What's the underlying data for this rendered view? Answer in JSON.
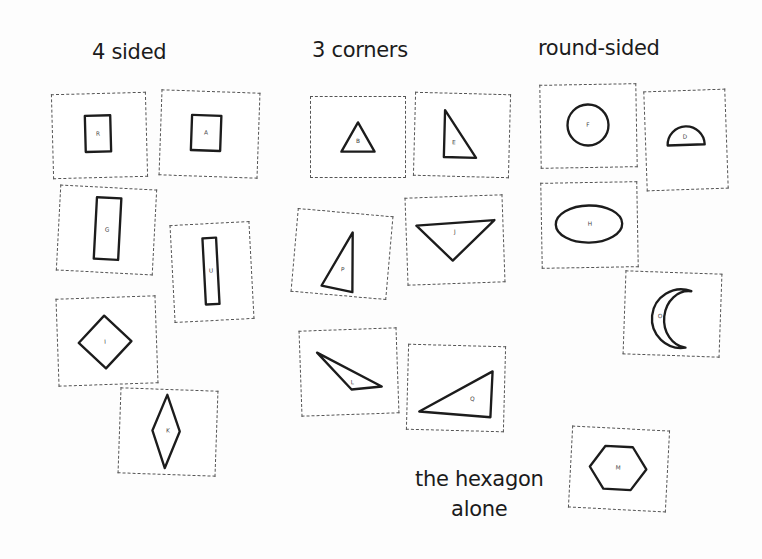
{
  "headings": {
    "four_sided": "4 sided",
    "three_corners": "3 corners",
    "round_sided": "round-sided",
    "hexagon_line1": "the hexagon",
    "hexagon_line2": "alone"
  },
  "colors": {
    "ink": "#1c1c1c",
    "dash": "#555555",
    "paper": "#fdfdfd"
  },
  "groups": [
    {
      "name": "four-sided",
      "cards": [
        {
          "label": "R",
          "shape": "square",
          "x": 52,
          "y": 93,
          "w": 95,
          "h": 85,
          "rot": -1.5,
          "pts": "33,22 59,22 59,59 33,59",
          "lx": 46,
          "ly": 41
        },
        {
          "label": "A",
          "shape": "square",
          "x": 160,
          "y": 91,
          "w": 99,
          "h": 86,
          "rot": 2,
          "pts": "31,24 61,24 61,60 31,60",
          "lx": 46,
          "ly": 42
        },
        {
          "label": "G",
          "shape": "rectangle",
          "x": 58,
          "y": 187,
          "w": 97,
          "h": 86,
          "rot": 3,
          "pts": "37,10 62,10 62,73 37,73",
          "lx": 49,
          "ly": 43
        },
        {
          "label": "U",
          "shape": "rectangle",
          "x": 172,
          "y": 223,
          "w": 80,
          "h": 98,
          "rot": -3,
          "pts": "32,14 46,14 46,82 32,82",
          "lx": 39,
          "ly": 48
        },
        {
          "label": "I",
          "shape": "rhombus-square",
          "x": 57,
          "y": 297,
          "w": 100,
          "h": 88,
          "rot": -2,
          "pts": "48,18 75,45 48,72 21,45",
          "lx": 48,
          "ly": 45
        },
        {
          "label": "K",
          "shape": "rhombus",
          "x": 119,
          "y": 389,
          "w": 98,
          "h": 86,
          "rot": 2,
          "pts": "47,5 61,42 47,80 33,42",
          "lx": 49,
          "ly": 42
        }
      ]
    },
    {
      "name": "three-corners",
      "cards": [
        {
          "label": "B",
          "shape": "equilateral-triangle",
          "x": 310,
          "y": 96,
          "w": 96,
          "h": 82,
          "rot": 0,
          "pts": "48,26 65,56 31,56",
          "lx": 48,
          "ly": 46
        },
        {
          "label": "E",
          "shape": "right-triangle",
          "x": 414,
          "y": 93,
          "w": 96,
          "h": 84,
          "rot": 1.5,
          "pts": "30,17 63,65 30,65",
          "lx": 40,
          "ly": 50
        },
        {
          "label": "P",
          "shape": "acute-triangle",
          "x": 294,
          "y": 212,
          "w": 96,
          "h": 84,
          "rot": 5,
          "pts": "57,19 62,80 30,76",
          "lx": 50,
          "ly": 58
        },
        {
          "label": "J",
          "shape": "inverted-triangle",
          "x": 406,
          "y": 196,
          "w": 98,
          "h": 88,
          "rot": -2,
          "pts": "10,28 90,25 46,65",
          "lx": 49,
          "ly": 36
        },
        {
          "label": "L",
          "shape": "obtuse-triangle",
          "x": 300,
          "y": 329,
          "w": 98,
          "h": 86,
          "rot": -2,
          "pts": "17,22 82,59 51,61",
          "lx": 52,
          "ly": 54
        },
        {
          "label": "Q",
          "shape": "scalene-triangle",
          "x": 407,
          "y": 345,
          "w": 98,
          "h": 86,
          "rot": 1.5,
          "pts": "12,68 86,25 85,72",
          "lx": 66,
          "ly": 54
        }
      ]
    },
    {
      "name": "round-sided",
      "cards": [
        {
          "label": "F",
          "shape": "circle",
          "x": 540,
          "y": 84,
          "w": 97,
          "h": 84,
          "rot": -1,
          "cx": 48,
          "cy": 41,
          "rx": 21,
          "ry": 21,
          "lx": 48,
          "ly": 41
        },
        {
          "label": "D",
          "shape": "semicircle",
          "x": 645,
          "y": 90,
          "w": 82,
          "h": 100,
          "rot": -2,
          "path": "M 22 55 A 19 19 0 0 1 60 55 Z",
          "lx": 40,
          "ly": 47
        },
        {
          "label": "H",
          "shape": "ellipse",
          "x": 541,
          "y": 182,
          "w": 97,
          "h": 86,
          "rot": -1,
          "cx": 48,
          "cy": 42,
          "rx": 34,
          "ry": 19,
          "lx": 49,
          "ly": 42
        },
        {
          "label": "O",
          "shape": "crescent",
          "x": 624,
          "y": 272,
          "w": 97,
          "h": 84,
          "rot": 2,
          "path": "M 67 18 A 30 30 0 1 0 63 76 A 24 28 0 1 1 67 18 Z",
          "lx": 36,
          "ly": 45
        },
        {
          "label": "M",
          "shape": "hexagon",
          "x": 570,
          "y": 428,
          "w": 98,
          "h": 82,
          "rot": 3,
          "pts": "34,18 62,18 77,40 62,62 34,62 19,40",
          "lx": 48,
          "ly": 40
        }
      ]
    }
  ]
}
